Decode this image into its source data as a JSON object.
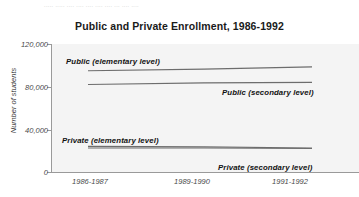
{
  "figure": {
    "scan_artifact_text": "..... ..... ....   .... ....    .... ....     ... .... ...."
  },
  "chart_data": {
    "type": "line",
    "title": "Public and Private Enrollment, 1986-1992",
    "xlabel": "",
    "ylabel": "Number of students",
    "x": [
      "1986-1987",
      "1989-1990",
      "1991-1992"
    ],
    "xtick_labels": [
      "1986-1987",
      "1989-1990",
      "1991-1992"
    ],
    "ytick_labels": [
      "120,000",
      "80,000",
      "40,000",
      "0"
    ],
    "ytick_values": [
      120000,
      80000,
      40000,
      0
    ],
    "ylim": [
      0,
      120000
    ],
    "grid": false,
    "legend_position": "inline-annotations",
    "line_color": "#6d6d6d",
    "plot_background": "#f4f4f4",
    "series": [
      {
        "name": "Public (elementary level)",
        "label": "Public (elementary level)",
        "values": [
          95000,
          96500,
          98500
        ]
      },
      {
        "name": "Public (secondary level)",
        "label": "Public (secondary level)",
        "values": [
          82000,
          83500,
          84000
        ]
      },
      {
        "name": "Private (elementary level)",
        "label": "Private (elementary level)",
        "values": [
          24000,
          23500,
          22500
        ]
      },
      {
        "name": "Private (secondary level)",
        "label": "Private (secondary level)",
        "values": [
          22500,
          22500,
          22000
        ]
      }
    ]
  }
}
